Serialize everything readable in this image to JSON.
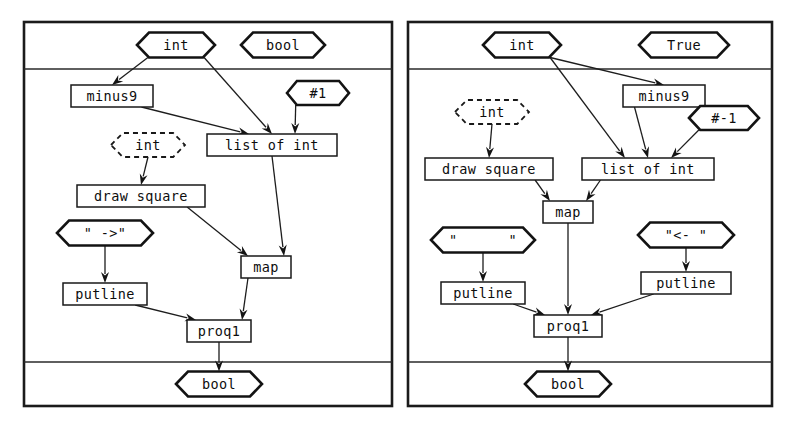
{
  "figure": {
    "type": "dataflow-graph-pair",
    "panel_count": 2
  },
  "panels": [
    {
      "id": "left",
      "name": "left-dataflow-panel",
      "frame": {
        "x": 24,
        "y": 22,
        "w": 368,
        "h": 384
      },
      "dividers": [
        69,
        362
      ],
      "inputs": [
        {
          "id": "L-in-int",
          "label": "int",
          "shape": "hexagon",
          "cx": 176,
          "cy": 45,
          "w": 78,
          "h": 25
        },
        {
          "id": "L-in-bool",
          "label": "bool",
          "shape": "hexagon",
          "cx": 283,
          "cy": 45,
          "w": 84,
          "h": 25
        }
      ],
      "nodes": [
        {
          "id": "L-minus9",
          "label": "minus9",
          "shape": "box",
          "cx": 112,
          "cy": 96,
          "w": 82,
          "h": 22
        },
        {
          "id": "L-hash1",
          "label": "#1",
          "shape": "hexagon",
          "cx": 318,
          "cy": 93,
          "w": 62,
          "h": 24
        },
        {
          "id": "L-int-dashed",
          "label": "int",
          "shape": "hexagon-dashed",
          "cx": 148,
          "cy": 145,
          "w": 74,
          "h": 24
        },
        {
          "id": "L-listofint",
          "label": "list of int",
          "shape": "box",
          "cx": 272,
          "cy": 145,
          "w": 130,
          "h": 22
        },
        {
          "id": "L-drawsquare",
          "label": "draw square",
          "shape": "box",
          "cx": 141,
          "cy": 196,
          "w": 128,
          "h": 22
        },
        {
          "id": "L-str-arrow",
          "label": "\" ->\"",
          "shape": "hexagon",
          "cx": 105,
          "cy": 233,
          "w": 96,
          "h": 25
        },
        {
          "id": "L-map",
          "label": "map",
          "shape": "box",
          "cx": 266,
          "cy": 267,
          "w": 50,
          "h": 22
        },
        {
          "id": "L-putline",
          "label": "putline",
          "shape": "box",
          "cx": 105,
          "cy": 294,
          "w": 84,
          "h": 22
        },
        {
          "id": "L-proq1",
          "label": "proq1",
          "shape": "box",
          "cx": 219,
          "cy": 331,
          "w": 64,
          "h": 22
        }
      ],
      "outputs": [
        {
          "id": "L-out-bool",
          "label": "bool",
          "shape": "hexagon",
          "cx": 219,
          "cy": 384,
          "w": 86,
          "h": 25
        }
      ],
      "edges": [
        {
          "from": "L-in-int",
          "to": "L-minus9"
        },
        {
          "from": "L-in-int",
          "to": "L-listofint"
        },
        {
          "from": "L-minus9",
          "to": "L-listofint"
        },
        {
          "from": "L-hash1",
          "to": "L-listofint"
        },
        {
          "from": "L-int-dashed",
          "to": "L-drawsquare"
        },
        {
          "from": "L-listofint",
          "to": "L-map"
        },
        {
          "from": "L-drawsquare",
          "to": "L-map"
        },
        {
          "from": "L-str-arrow",
          "to": "L-putline"
        },
        {
          "from": "L-map",
          "to": "L-proq1"
        },
        {
          "from": "L-putline",
          "to": "L-proq1"
        },
        {
          "from": "L-proq1",
          "to": "L-out-bool"
        }
      ]
    },
    {
      "id": "right",
      "name": "right-dataflow-panel",
      "frame": {
        "x": 408,
        "y": 22,
        "w": 364,
        "h": 384
      },
      "dividers": [
        69,
        362
      ],
      "inputs": [
        {
          "id": "R-in-int",
          "label": "int",
          "shape": "hexagon",
          "cx": 522,
          "cy": 45,
          "w": 78,
          "h": 25
        },
        {
          "id": "R-in-true",
          "label": "True",
          "shape": "hexagon",
          "cx": 684,
          "cy": 45,
          "w": 90,
          "h": 25
        }
      ],
      "nodes": [
        {
          "id": "R-minus9",
          "label": "minus9",
          "shape": "box",
          "cx": 664,
          "cy": 96,
          "w": 82,
          "h": 22
        },
        {
          "id": "R-int-dashed",
          "label": "int",
          "shape": "hexagon-dashed",
          "cx": 492,
          "cy": 112,
          "w": 74,
          "h": 24
        },
        {
          "id": "R-hash-1",
          "label": "#-1",
          "shape": "hexagon",
          "cx": 724,
          "cy": 118,
          "w": 70,
          "h": 24
        },
        {
          "id": "R-drawsquare",
          "label": "draw square",
          "shape": "box",
          "cx": 489,
          "cy": 169,
          "w": 128,
          "h": 22
        },
        {
          "id": "R-listofint",
          "label": "list of int",
          "shape": "box",
          "cx": 648,
          "cy": 169,
          "w": 132,
          "h": 22
        },
        {
          "id": "R-map",
          "label": "map",
          "shape": "box",
          "cx": 568,
          "cy": 212,
          "w": 50,
          "h": 22
        },
        {
          "id": "R-str-blank",
          "label": "\"      \"",
          "shape": "hexagon",
          "cx": 483,
          "cy": 240,
          "w": 104,
          "h": 25
        },
        {
          "id": "R-str-larrow",
          "label": "\"<- \"",
          "shape": "hexagon",
          "cx": 686,
          "cy": 235,
          "w": 96,
          "h": 25
        },
        {
          "id": "R-putline-left",
          "label": "putline",
          "shape": "box",
          "cx": 483,
          "cy": 293,
          "w": 84,
          "h": 22
        },
        {
          "id": "R-putline-right",
          "label": "putline",
          "shape": "box",
          "cx": 686,
          "cy": 283,
          "w": 90,
          "h": 22
        },
        {
          "id": "R-proq1",
          "label": "proq1",
          "shape": "box",
          "cx": 568,
          "cy": 326,
          "w": 68,
          "h": 22
        }
      ],
      "outputs": [
        {
          "id": "R-out-bool",
          "label": "bool",
          "shape": "hexagon",
          "cx": 568,
          "cy": 384,
          "w": 86,
          "h": 25
        }
      ],
      "edges": [
        {
          "from": "R-in-int",
          "to": "R-minus9"
        },
        {
          "from": "R-in-int",
          "to": "R-listofint"
        },
        {
          "from": "R-minus9",
          "to": "R-listofint"
        },
        {
          "from": "R-hash-1",
          "to": "R-listofint"
        },
        {
          "from": "R-int-dashed",
          "to": "R-drawsquare"
        },
        {
          "from": "R-drawsquare",
          "to": "R-map"
        },
        {
          "from": "R-listofint",
          "to": "R-map"
        },
        {
          "from": "R-str-blank",
          "to": "R-putline-left"
        },
        {
          "from": "R-str-larrow",
          "to": "R-putline-right"
        },
        {
          "from": "R-map",
          "to": "R-proq1"
        },
        {
          "from": "R-putline-left",
          "to": "R-proq1"
        },
        {
          "from": "R-putline-right",
          "to": "R-proq1"
        },
        {
          "from": "R-proq1",
          "to": "R-out-bool"
        }
      ]
    }
  ],
  "colors": {
    "background": "#ffffff",
    "stroke": "#141414",
    "frame": "#1b1b1b",
    "text": "#0d0d0d"
  }
}
